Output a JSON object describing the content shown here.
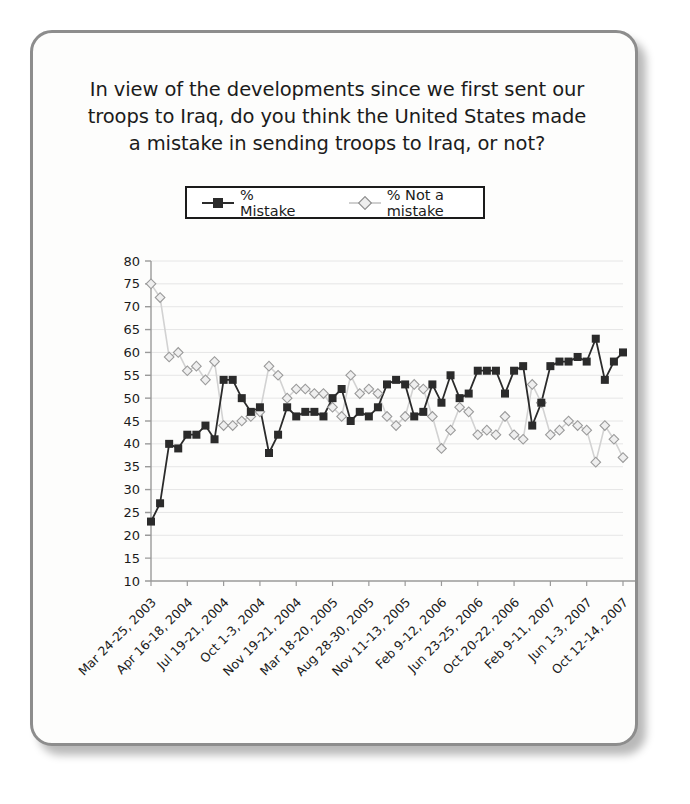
{
  "card": {
    "border_color": "#8d8d8d",
    "background": "#fdfdfc"
  },
  "title": {
    "line1": "In view of the developments since we first sent our",
    "line2": "troops to Iraq, do you think the United States made",
    "line3": "a mistake in sending troops to Iraq, or not?"
  },
  "legend": {
    "items": [
      {
        "label": "% Mistake",
        "marker": "filled-square",
        "color": "#2b2b2b"
      },
      {
        "label": "% Not a mistake",
        "marker": "open-diamond",
        "color": "#c9c9c9"
      }
    ]
  },
  "end_labels": {
    "mistake": "60",
    "not_a_mistake": "37"
  },
  "chart_data": {
    "type": "line",
    "title": "In view of the developments since we first sent our troops to Iraq, do you think the United States made a mistake in sending troops to Iraq, or not?",
    "xlabel": "",
    "ylabel": "",
    "ylim": [
      10,
      80
    ],
    "ytick_step": 5,
    "yticks": [
      10,
      15,
      20,
      25,
      30,
      35,
      40,
      45,
      50,
      55,
      60,
      65,
      70,
      75,
      80
    ],
    "grid": true,
    "legend_position": "top-center",
    "xtick_labels": [
      "Mar 24-25, 2003",
      "Apr 16-18, 2004",
      "Jul 19-21, 2004",
      "Oct 1-3, 2004",
      "Nov 19-21, 2004",
      "Mar 18-20, 2005",
      "Aug 28-30, 2005",
      "Nov 11-13, 2005",
      "Feb 9-12, 2006",
      "Jun 23-25, 2006",
      "Oct 20-22, 2006",
      "Feb 9-11, 2007",
      "Jun 1-3, 2007",
      "Oct 12-14, 2007"
    ],
    "xtick_indices": [
      0,
      4,
      8,
      12,
      16,
      20,
      24,
      28,
      32,
      36,
      40,
      44,
      48,
      52
    ],
    "series": [
      {
        "name": "% Mistake",
        "color": "#2b2b2b",
        "marker": "filled-square",
        "values": [
          23,
          27,
          40,
          39,
          42,
          42,
          44,
          41,
          54,
          54,
          50,
          47,
          48,
          38,
          42,
          48,
          46,
          47,
          47,
          46,
          50,
          52,
          45,
          47,
          46,
          48,
          53,
          54,
          53,
          46,
          47,
          53,
          49,
          55,
          50,
          51,
          56,
          56,
          56,
          51,
          56,
          57,
          44,
          49,
          57,
          58,
          58,
          59,
          58,
          63,
          54,
          58,
          60
        ]
      },
      {
        "name": "% Not a mistake",
        "color": "#c9c9c9",
        "marker": "open-diamond",
        "values": [
          75,
          72,
          59,
          60,
          56,
          57,
          54,
          58,
          44,
          44,
          45,
          46,
          47,
          57,
          55,
          50,
          52,
          52,
          51,
          51,
          48,
          46,
          55,
          51,
          52,
          51,
          46,
          44,
          46,
          53,
          52,
          46,
          39,
          43,
          48,
          47,
          42,
          43,
          42,
          46,
          42,
          41,
          53,
          49,
          42,
          43,
          45,
          44,
          43,
          36,
          44,
          41,
          37
        ]
      }
    ]
  }
}
